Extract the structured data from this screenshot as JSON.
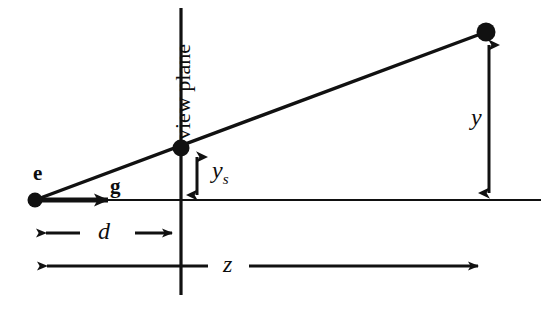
{
  "figure": {
    "stroke_color": "#111111",
    "background_color": "#ffffff"
  },
  "labels": {
    "eye": "e",
    "gaze": "g",
    "view_plane": "view plane",
    "y_screen": "y",
    "y_screen_sub": "s",
    "y_world": "y",
    "d_distance": "d",
    "z_distance": "z"
  },
  "geometry": {
    "eye_point": {
      "x": 35,
      "y": 200,
      "radius": 7
    },
    "image_point": {
      "x": 181,
      "y": 148,
      "radius": 8
    },
    "world_point": {
      "x": 486,
      "y": 32,
      "radius": 9
    },
    "axis_line": {
      "x1": 35,
      "y1": 200,
      "x2": 541,
      "y2": 200
    },
    "view_plane_line": {
      "x": 181,
      "y1": 8,
      "y2": 295
    },
    "view_ray": {
      "x1": 35,
      "y1": 200,
      "x2": 486,
      "y2": 32
    },
    "gaze_arrow": {
      "x1": 35,
      "y1": 200,
      "x2": 122,
      "y2": 200
    },
    "y_screen_arrow": {
      "x": 197,
      "y1": 152,
      "y2": 200
    },
    "y_world_arrow": {
      "x": 489,
      "y1": 40,
      "y2": 200
    },
    "d_dimension": {
      "y": 233,
      "x1": 34,
      "x2": 181
    },
    "z_dimension": {
      "y": 266,
      "x1": 35,
      "x2": 487
    }
  },
  "label_positions": {
    "eye": {
      "left": 33,
      "top": 163
    },
    "gaze": {
      "left": 110,
      "top": 176
    },
    "view_plane": {
      "left": 172,
      "top": 140
    },
    "y_screen": {
      "left": 212,
      "top": 158
    },
    "y_world": {
      "left": 471,
      "top": 105
    },
    "d_distance": {
      "left": 98,
      "top": 219
    },
    "z_distance": {
      "left": 223,
      "top": 252
    }
  }
}
